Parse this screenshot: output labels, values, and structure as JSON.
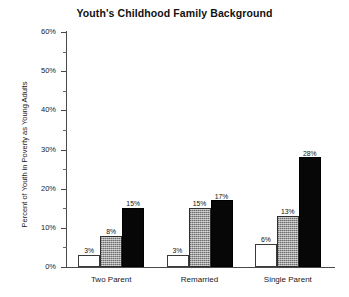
{
  "chart_data": {
    "type": "bar",
    "title": "Youth's Childhood Family Background",
    "xlabel": "",
    "ylabel": "Percent of Youth in Poverty as Young Adults",
    "categories": [
      "Two Parent",
      "Remarried",
      "Single Parent"
    ],
    "series": [
      {
        "name": "series-1",
        "fill": "white",
        "values": [
          3,
          3,
          6
        ],
        "labels": [
          "3%",
          "3%",
          "6%"
        ]
      },
      {
        "name": "series-2",
        "fill": "gray",
        "values": [
          8,
          15,
          13
        ],
        "labels": [
          "8%",
          "15%",
          "13%"
        ]
      },
      {
        "name": "series-3",
        "fill": "black",
        "values": [
          15,
          17,
          28
        ],
        "labels": [
          "15%",
          "17%",
          "28%"
        ]
      }
    ],
    "ylim": [
      0,
      60
    ],
    "ytick_values": [
      0,
      10,
      20,
      30,
      40,
      50,
      60
    ],
    "ytick_labels": [
      "0%",
      "10%",
      "20%",
      "30%",
      "40%",
      "50%",
      "60%"
    ],
    "yminor_values": [
      5,
      15,
      25,
      35,
      45,
      55
    ],
    "grid": false,
    "legend": false,
    "value_label_suffix": "%",
    "colors": {
      "series_white": "#ffffff",
      "series_gray": "#9d9d9d",
      "series_black": "#070707",
      "axis": "#4a4a4a",
      "text": "#1a1a1a",
      "background": "#ffffff"
    }
  }
}
